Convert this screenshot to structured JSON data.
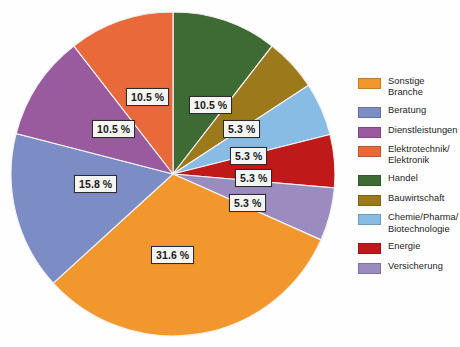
{
  "chart_data": {
    "type": "pie",
    "title": "",
    "subtitle": "",
    "xlabel": "",
    "ylabel": "",
    "grid": false,
    "legend_position": "right",
    "start_angle_deg": 0,
    "direction": "clockwise",
    "unit": "%",
    "categories": [
      "Handel",
      "Bauwirtschaft",
      "Chemie/Pharma/Biotechnologie",
      "Energie",
      "Versicherung",
      "Sonstige Branche",
      "Beratung",
      "Dienstleistungen",
      "Elektrotechnik/Elektronik"
    ],
    "values": [
      10.5,
      5.3,
      5.3,
      5.3,
      5.3,
      31.6,
      15.8,
      10.5,
      10.5
    ],
    "value_labels": [
      "10.5 %",
      "5.3 %",
      "5.3 %",
      "5.3 %",
      "5.3 %",
      "31.6 %",
      "15.8 %",
      "10.5 %",
      "10.5 %"
    ],
    "colors": [
      "#3d6b33",
      "#9c7a1c",
      "#88bce5",
      "#c0191a",
      "#9b8bbf",
      "#f2972e",
      "#7c8dc6",
      "#9a5a9e",
      "#ea693b"
    ],
    "slices": [
      {
        "label": "Handel",
        "value": 10.5,
        "value_label": "10.5 %",
        "color": "#3d6b33"
      },
      {
        "label": "Bauwirtschaft",
        "value": 5.3,
        "value_label": "5.3 %",
        "color": "#9c7a1c"
      },
      {
        "label": "Chemie/Pharma/Biotechnologie",
        "value": 5.3,
        "value_label": "5.3 %",
        "color": "#88bce5"
      },
      {
        "label": "Energie",
        "value": 5.3,
        "value_label": "5.3 %",
        "color": "#c0191a"
      },
      {
        "label": "Versicherung",
        "value": 5.3,
        "value_label": "5.3 %",
        "color": "#9b8bbf"
      },
      {
        "label": "Sonstige Branche",
        "value": 31.6,
        "value_label": "31.6 %",
        "color": "#f2972e"
      },
      {
        "label": "Beratung",
        "value": 15.8,
        "value_label": "15.8 %",
        "color": "#7c8dc6"
      },
      {
        "label": "Dienstleistungen",
        "value": 10.5,
        "value_label": "10.5 %",
        "color": "#9a5a9e"
      },
      {
        "label": "Elektrotechnik/Elektronik",
        "value": 10.5,
        "value_label": "10.5 %",
        "color": "#ea693b"
      }
    ]
  },
  "labels": {
    "handel": "10.5 %",
    "bauwirtschaft": "5.3 %",
    "chemie": "5.3 %",
    "energie": "5.3 %",
    "versicherung": "5.3 %",
    "sonstige": "31.6 %",
    "beratung": "15.8 %",
    "dienstleistungen": "10.5 %",
    "elektrotechnik": "10.5 %"
  },
  "legend": {
    "items": [
      {
        "label": "Sonstige Branche",
        "color": "#f2972e"
      },
      {
        "label": "Beratung",
        "color": "#7c8dc6"
      },
      {
        "label": "Dienstleistungen",
        "color": "#9a5a9e"
      },
      {
        "label": "Elektrotechnik/\nElektronik",
        "color": "#ea693b"
      },
      {
        "label": "Handel",
        "color": "#3d6b33"
      },
      {
        "label": "Bauwirtschaft",
        "color": "#9c7a1c"
      },
      {
        "label": "Chemie/Pharma/\nBiotechnologie",
        "color": "#88bce5"
      },
      {
        "label": "Energie",
        "color": "#c0191a"
      },
      {
        "label": "Versicherung",
        "color": "#9b8bbf"
      }
    ]
  }
}
